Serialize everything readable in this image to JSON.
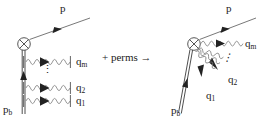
{
  "figure": {
    "type": "feynman-diagram",
    "ink_color": "#222222",
    "background": "#ffffff"
  },
  "left_diagram": {
    "name": "ladder-emission-diagram",
    "vertex": {
      "style": "crossed-circle",
      "cx": 24,
      "cy": 44,
      "r": 6.5
    },
    "outgoing_fermion_label": "p",
    "incoming_eikonal_label": "p",
    "incoming_eikonal_sub": "b",
    "gluons": [
      {
        "label": "q",
        "sub": "m",
        "y": 62
      },
      {
        "label": "q",
        "sub": "2",
        "y": 88
      },
      {
        "label": "q",
        "sub": "1",
        "y": 100
      }
    ],
    "vertical_dots": "⋮"
  },
  "connector": {
    "name": "perms-connector",
    "text": "+ perms",
    "arrow": "→"
  },
  "right_diagram": {
    "name": "fan-emission-diagram",
    "vertex": {
      "style": "crossed-circle",
      "cx": 194,
      "cy": 44,
      "r": 6.5
    },
    "outgoing_fermion_label": "p",
    "incoming_eikonal_label": "p",
    "incoming_eikonal_sub": "b",
    "gluons": [
      {
        "label": "q",
        "sub": "m"
      },
      {
        "label": "q",
        "sub": "2"
      },
      {
        "label": "q",
        "sub": "1"
      }
    ],
    "diagonal_dots": "⋰"
  },
  "labels": {
    "left_p": "p",
    "left_pb_main": "p",
    "left_pb_sub": "b",
    "left_qm_main": "q",
    "left_qm_sub": "m",
    "left_q2_main": "q",
    "left_q2_sub": "2",
    "left_q1_main": "q",
    "left_q1_sub": "1",
    "right_p": "p",
    "right_pb_main": "p",
    "right_pb_sub": "b",
    "right_qm_main": "q",
    "right_qm_sub": "m",
    "right_q2_main": "q",
    "right_q2_sub": "2",
    "right_q1_main": "q",
    "right_q1_sub": "1",
    "perms": "+ perms",
    "perms_arrow": "→",
    "ellipsis_vertical": "⋮"
  }
}
